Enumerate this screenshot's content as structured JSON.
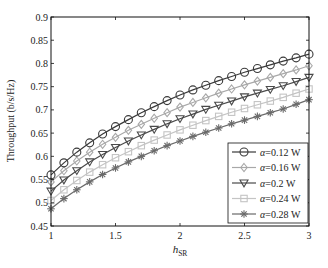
{
  "chart_data": {
    "type": "line",
    "title": "",
    "xlabel": "h",
    "xlabel_sub": "SR",
    "ylabel": "Throughput (b/s/Hz)",
    "xlim": [
      1,
      3
    ],
    "ylim": [
      0.45,
      0.9
    ],
    "xticks": [
      1,
      1.5,
      2,
      2.5,
      3
    ],
    "xtick_labels": [
      "1",
      "1.5",
      "2",
      "2.5",
      "3"
    ],
    "yticks": [
      0.45,
      0.5,
      0.55,
      0.6,
      0.65,
      0.7,
      0.75,
      0.8,
      0.85,
      0.9
    ],
    "ytick_labels": [
      "0.45",
      "0.5",
      "0.55",
      "0.6",
      "0.65",
      "0.7",
      "0.75",
      "0.8",
      "0.85",
      "0.9"
    ],
    "grid": false,
    "legend_position": "lower right",
    "x": [
      1.0,
      1.1,
      1.2,
      1.3,
      1.4,
      1.5,
      1.6,
      1.7,
      1.8,
      1.9,
      2.0,
      2.1,
      2.2,
      2.3,
      2.4,
      2.5,
      2.6,
      2.7,
      2.8,
      2.9,
      3.0
    ],
    "series": [
      {
        "name": "α=0.12 W",
        "alpha_label": "α",
        "value_label": "=0.12 W",
        "marker": "circle",
        "color": "#3a3a3a",
        "values": [
          0.56,
          0.586,
          0.609,
          0.629,
          0.648,
          0.664,
          0.679,
          0.694,
          0.707,
          0.72,
          0.732,
          0.743,
          0.753,
          0.763,
          0.772,
          0.781,
          0.789,
          0.797,
          0.805,
          0.812,
          0.82
        ]
      },
      {
        "name": "α=0.16 W",
        "alpha_label": "α",
        "value_label": "=0.16 W",
        "marker": "diamond",
        "color": "#a8a8a8",
        "values": [
          0.545,
          0.569,
          0.59,
          0.609,
          0.626,
          0.641,
          0.656,
          0.669,
          0.682,
          0.694,
          0.706,
          0.716,
          0.726,
          0.736,
          0.745,
          0.754,
          0.762,
          0.77,
          0.778,
          0.786,
          0.795
        ]
      },
      {
        "name": "α=0.2 W",
        "alpha_label": "α",
        "value_label": "=0.2 W",
        "marker": "triangle-down",
        "color": "#4a4a4a",
        "values": [
          0.525,
          0.549,
          0.569,
          0.588,
          0.604,
          0.619,
          0.633,
          0.646,
          0.658,
          0.67,
          0.681,
          0.691,
          0.701,
          0.71,
          0.719,
          0.728,
          0.736,
          0.744,
          0.752,
          0.761,
          0.77
        ]
      },
      {
        "name": "α=0.24 W",
        "alpha_label": "α",
        "value_label": "=0.24 W",
        "marker": "square",
        "color": "#c4c4c4",
        "values": [
          0.505,
          0.528,
          0.548,
          0.566,
          0.582,
          0.597,
          0.61,
          0.623,
          0.635,
          0.646,
          0.657,
          0.667,
          0.677,
          0.686,
          0.695,
          0.703,
          0.711,
          0.719,
          0.727,
          0.736,
          0.745
        ]
      },
      {
        "name": "α=0.28 W",
        "alpha_label": "α",
        "value_label": "=0.28 W",
        "marker": "asterisk",
        "color": "#6a6a6a",
        "values": [
          0.487,
          0.509,
          0.528,
          0.545,
          0.561,
          0.575,
          0.588,
          0.6,
          0.612,
          0.623,
          0.633,
          0.643,
          0.652,
          0.661,
          0.67,
          0.678,
          0.686,
          0.694,
          0.702,
          0.712,
          0.722
        ]
      }
    ]
  }
}
